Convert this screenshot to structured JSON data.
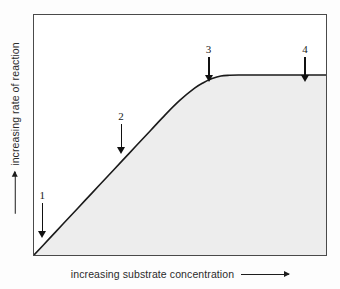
{
  "figure": {
    "background_color": "#fdfdfd",
    "plot_background_color": "#ffffff",
    "frame_color": "#4a4a4a"
  },
  "axes": {
    "y_label": "increasing rate of reaction",
    "y_arrow_icon": "up-arrow",
    "x_label": "increasing substrate concentration",
    "x_arrow_icon": "right-arrow"
  },
  "markers": [
    {
      "label": "1",
      "arrow_icon": "down-arrow"
    },
    {
      "label": "2",
      "arrow_icon": "down-arrow"
    },
    {
      "label": "3",
      "arrow_icon": "down-arrow"
    },
    {
      "label": "4",
      "arrow_icon": "down-arrow"
    }
  ],
  "chart_data": {
    "type": "line",
    "title": "",
    "xlabel": "increasing substrate concentration",
    "ylabel": "increasing rate of reaction",
    "xlim": [
      0,
      100
    ],
    "ylim": [
      0,
      100
    ],
    "grid": false,
    "legend": false,
    "axis_ticks": false,
    "curve_color": "#1a1a1a",
    "fill_color": "#ededed",
    "fill_under_curve": true,
    "series": [
      {
        "name": "rate of reaction",
        "x": [
          0,
          5,
          10,
          15,
          20,
          25,
          30,
          35,
          40,
          45,
          50,
          55,
          58,
          61,
          64,
          67,
          70,
          75,
          80,
          85,
          90,
          95,
          100
        ],
        "y": [
          0,
          6.5,
          13,
          19.5,
          26,
          32.5,
          39,
          45.5,
          52,
          58.5,
          64.5,
          69.5,
          71.8,
          73.5,
          74.6,
          74.9,
          75,
          75,
          75,
          75,
          75,
          75,
          75
        ]
      }
    ],
    "annotations": [
      {
        "label": "1",
        "x": 4,
        "y_tip": 10,
        "y_text": 27,
        "note": "initial steep linear region near origin"
      },
      {
        "label": "2",
        "x": 31,
        "y_tip": 45,
        "y_text": 60,
        "note": "linear region, rate proportional to substrate"
      },
      {
        "label": "3",
        "x": 61,
        "y_tip": 75,
        "y_text": 88,
        "note": "curve begins to plateau"
      },
      {
        "label": "4",
        "x": 94,
        "y_tip": 75,
        "y_text": 88,
        "note": "plateau, maximum rate reached"
      }
    ]
  }
}
